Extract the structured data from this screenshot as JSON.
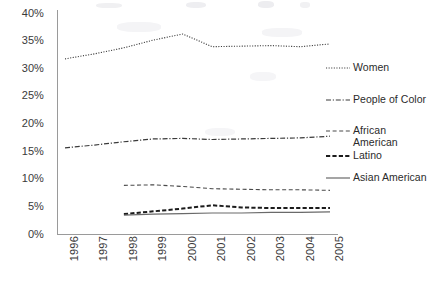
{
  "chart_data": {
    "type": "line",
    "title": "",
    "xlabel": "",
    "ylabel": "",
    "x": [
      1996,
      1997,
      1998,
      1999,
      2000,
      2001,
      2002,
      2003,
      2004,
      2005
    ],
    "categories": [
      "1996",
      "1997",
      "1998",
      "1999",
      "2000",
      "2001",
      "2002",
      "2003",
      "2004",
      "2005"
    ],
    "ylim": [
      0,
      40
    ],
    "yticks": [
      0,
      5,
      10,
      15,
      20,
      25,
      30,
      35,
      40
    ],
    "ytick_labels": [
      "0%",
      "5%",
      "10%",
      "15%",
      "20%",
      "25%",
      "30%",
      "35%",
      "40%"
    ],
    "grid": false,
    "legend_position": "right",
    "units": "percent",
    "series": [
      {
        "name": "Women",
        "line_style": "dotted",
        "color": "#3a3a3a",
        "x": [
          1996,
          1997,
          1998,
          1999,
          2000,
          2001,
          2002,
          2003,
          2004,
          2005
        ],
        "values": [
          31.7,
          32.6,
          33.7,
          35.1,
          36.2,
          33.9,
          34.0,
          34.1,
          33.9,
          34.4
        ]
      },
      {
        "name": "People of Color",
        "line_style": "dash-dot",
        "color": "#3a3a3a",
        "x": [
          1996,
          1997,
          1998,
          1999,
          2000,
          2001,
          2002,
          2003,
          2004,
          2005
        ],
        "values": [
          15.6,
          16.1,
          16.7,
          17.2,
          17.3,
          17.1,
          17.2,
          17.3,
          17.4,
          17.7
        ]
      },
      {
        "name": "African American",
        "line_style": "dashed",
        "color": "#4a4a4a",
        "x": [
          1998,
          1999,
          2000,
          2001,
          2002,
          2003,
          2004,
          2005
        ],
        "values": [
          8.8,
          8.9,
          8.6,
          8.2,
          8.1,
          8.0,
          8.0,
          7.9
        ]
      },
      {
        "name": "Latino",
        "line_style": "dashed-bold",
        "color": "#1c1c1c",
        "x": [
          1998,
          1999,
          2000,
          2001,
          2002,
          2003,
          2004,
          2005
        ],
        "values": [
          3.6,
          4.1,
          4.6,
          5.2,
          4.8,
          4.7,
          4.7,
          4.7
        ]
      },
      {
        "name": "Asian American",
        "line_style": "solid",
        "color": "#6a6a6a",
        "x": [
          1998,
          1999,
          2000,
          2001,
          2002,
          2003,
          2004,
          2005
        ],
        "values": [
          3.4,
          3.6,
          3.7,
          3.8,
          3.8,
          3.9,
          3.9,
          4.0
        ]
      }
    ]
  },
  "legend": {
    "entries": [
      {
        "label": "Women",
        "style": "dotted"
      },
      {
        "label": "People of Color",
        "style": "dash-dot"
      },
      {
        "label": "African\nAmerican",
        "style": "dashed"
      },
      {
        "label": "Latino",
        "style": "dashed-bold"
      },
      {
        "label": "Asian American",
        "style": "solid"
      }
    ]
  },
  "axis_color": "#9a9a9a"
}
